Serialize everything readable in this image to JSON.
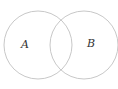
{
  "diagram": {
    "type": "venn",
    "sets": [
      {
        "id": "A",
        "label": "A",
        "cx": 38,
        "cy": 45,
        "r": 34,
        "label_x": 21,
        "label_y": 48
      },
      {
        "id": "B",
        "label": "B",
        "cx": 84,
        "cy": 45,
        "r": 34,
        "label_x": 87,
        "label_y": 47
      }
    ],
    "stroke_color": "#c8c8c8",
    "label_color": "#333333"
  }
}
